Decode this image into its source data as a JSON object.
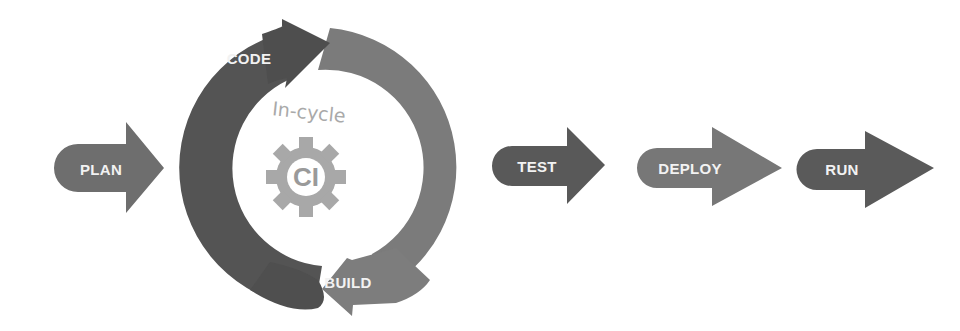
{
  "diagram": {
    "title": "",
    "pre_stage": {
      "label": "PLAN",
      "color": "#6f6f6f"
    },
    "cycle": {
      "caption": "In-cycle",
      "center_label": "CI",
      "center_icon": "gear-icon",
      "steps": [
        {
          "label": "CODE",
          "color": "#545454",
          "direction": "clockwise-top"
        },
        {
          "label": "BUILD",
          "color": "#7b7b7b",
          "direction": "clockwise-bottom"
        }
      ],
      "gear_color": "#a8a8a8"
    },
    "post_stages": [
      {
        "label": "TEST",
        "color": "#595959"
      },
      {
        "label": "DEPLOY",
        "color": "#777777"
      },
      {
        "label": "RUN",
        "color": "#5a5a5a"
      }
    ]
  }
}
